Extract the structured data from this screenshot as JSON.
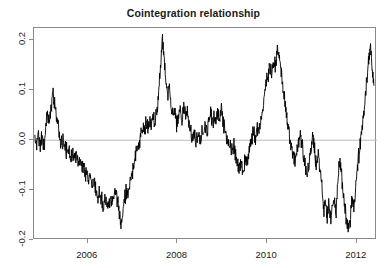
{
  "chart_data": {
    "type": "line",
    "title": "Cointegration relationship",
    "subtitle": "",
    "xlabel": "",
    "ylabel": "",
    "xlim": [
      2004.8,
      2012.45
    ],
    "ylim": [
      -0.2,
      0.225
    ],
    "grid": false,
    "legend": null,
    "zero_reference_line": 0.0,
    "line_color": "#000000",
    "zero_line_color": "#bcbcbc",
    "axis_color": "#8a8a8a",
    "background_color": "#ffffff",
    "xticks": [
      2006,
      2008,
      2010,
      2012
    ],
    "xtick_labels": [
      "2006",
      "2008",
      "2010",
      "2012"
    ],
    "yticks": [
      0.2,
      0.1,
      0.0,
      -0.1,
      -0.2
    ],
    "ytick_labels": [
      "0.2",
      "0.1",
      "0.0",
      "-0.1",
      "-0.2"
    ],
    "series": [
      {
        "name": "Cointegration residual",
        "x": [
          2004.82,
          2004.86,
          2004.9,
          2004.94,
          2004.98,
          2005.02,
          2005.06,
          2005.1,
          2005.14,
          2005.18,
          2005.22,
          2005.26,
          2005.3,
          2005.34,
          2005.38,
          2005.42,
          2005.46,
          2005.5,
          2005.54,
          2005.58,
          2005.62,
          2005.66,
          2005.7,
          2005.74,
          2005.78,
          2005.82,
          2005.86,
          2005.9,
          2005.94,
          2005.98,
          2006.02,
          2006.06,
          2006.1,
          2006.14,
          2006.18,
          2006.22,
          2006.26,
          2006.3,
          2006.34,
          2006.38,
          2006.42,
          2006.46,
          2006.5,
          2006.54,
          2006.58,
          2006.62,
          2006.66,
          2006.7,
          2006.74,
          2006.78,
          2006.82,
          2006.86,
          2006.9,
          2006.94,
          2006.98,
          2007.02,
          2007.06,
          2007.1,
          2007.14,
          2007.18,
          2007.22,
          2007.26,
          2007.3,
          2007.34,
          2007.38,
          2007.42,
          2007.46,
          2007.5,
          2007.54,
          2007.58,
          2007.62,
          2007.66,
          2007.7,
          2007.74,
          2007.78,
          2007.82,
          2007.86,
          2007.9,
          2007.94,
          2007.98,
          2008.02,
          2008.06,
          2008.1,
          2008.14,
          2008.18,
          2008.22,
          2008.26,
          2008.3,
          2008.34,
          2008.38,
          2008.42,
          2008.46,
          2008.5,
          2008.54,
          2008.58,
          2008.62,
          2008.66,
          2008.7,
          2008.74,
          2008.78,
          2008.82,
          2008.86,
          2008.9,
          2008.94,
          2008.98,
          2009.02,
          2009.06,
          2009.1,
          2009.14,
          2009.18,
          2009.22,
          2009.26,
          2009.3,
          2009.34,
          2009.38,
          2009.42,
          2009.46,
          2009.5,
          2009.54,
          2009.58,
          2009.62,
          2009.66,
          2009.7,
          2009.74,
          2009.78,
          2009.82,
          2009.86,
          2009.9,
          2009.94,
          2009.98,
          2010.02,
          2010.06,
          2010.1,
          2010.14,
          2010.18,
          2010.22,
          2010.26,
          2010.3,
          2010.34,
          2010.38,
          2010.42,
          2010.46,
          2010.5,
          2010.54,
          2010.58,
          2010.62,
          2010.66,
          2010.7,
          2010.74,
          2010.78,
          2010.82,
          2010.86,
          2010.9,
          2010.94,
          2010.98,
          2011.02,
          2011.06,
          2011.1,
          2011.14,
          2011.18,
          2011.22,
          2011.26,
          2011.3,
          2011.34,
          2011.38,
          2011.42,
          2011.46,
          2011.5,
          2011.54,
          2011.58,
          2011.62,
          2011.66,
          2011.7,
          2011.74,
          2011.78,
          2011.82,
          2011.86,
          2011.9,
          2011.94,
          2011.98,
          2012.02,
          2012.06,
          2012.1,
          2012.14,
          2012.18,
          2012.22,
          2012.26,
          2012.3,
          2012.34,
          2012.38
        ],
        "y": [
          0.0,
          -0.012,
          0.005,
          -0.008,
          0.004,
          -0.01,
          0.018,
          0.05,
          0.038,
          0.06,
          0.103,
          0.072,
          0.052,
          0.028,
          0.004,
          -0.006,
          -0.001,
          -0.012,
          -0.024,
          -0.018,
          -0.032,
          -0.026,
          -0.04,
          -0.034,
          -0.048,
          -0.042,
          -0.056,
          -0.05,
          -0.066,
          -0.06,
          -0.078,
          -0.072,
          -0.09,
          -0.084,
          -0.1,
          -0.11,
          -0.104,
          -0.118,
          -0.126,
          -0.12,
          -0.132,
          -0.126,
          -0.118,
          -0.128,
          -0.112,
          -0.104,
          -0.122,
          -0.142,
          -0.172,
          -0.14,
          -0.118,
          -0.1,
          -0.108,
          -0.088,
          -0.07,
          -0.056,
          -0.036,
          -0.02,
          -0.008,
          0.01,
          0.026,
          0.018,
          0.034,
          0.026,
          0.04,
          0.03,
          0.048,
          0.036,
          0.058,
          0.092,
          0.14,
          0.212,
          0.168,
          0.12,
          0.09,
          0.104,
          0.072,
          0.052,
          0.06,
          0.03,
          0.046,
          0.055,
          0.04,
          0.06,
          0.05,
          0.056,
          0.038,
          0.018,
          0.0,
          0.014,
          -0.008,
          0.01,
          -0.004,
          0.02,
          0.006,
          0.03,
          0.014,
          0.044,
          0.056,
          0.03,
          0.048,
          0.034,
          0.054,
          0.04,
          0.06,
          0.038,
          0.022,
          0.006,
          -0.014,
          -0.004,
          -0.022,
          -0.012,
          -0.03,
          -0.046,
          -0.058,
          -0.05,
          -0.062,
          -0.04,
          -0.048,
          -0.03,
          -0.014,
          0.004,
          0.018,
          0.006,
          0.026,
          0.014,
          0.04,
          0.06,
          0.09,
          0.118,
          0.13,
          0.15,
          0.138,
          0.16,
          0.148,
          0.172,
          0.176,
          0.15,
          0.12,
          0.09,
          0.06,
          0.032,
          0.01,
          -0.012,
          -0.028,
          -0.044,
          -0.026,
          -0.008,
          0.012,
          -0.01,
          -0.032,
          -0.055,
          -0.07,
          -0.04,
          -0.014,
          0.01,
          -0.02,
          -0.05,
          -0.03,
          -0.06,
          -0.09,
          -0.14,
          -0.122,
          -0.15,
          -0.128,
          -0.16,
          -0.138,
          -0.12,
          -0.142,
          -0.08,
          -0.04,
          -0.07,
          -0.11,
          -0.14,
          -0.17,
          -0.182,
          -0.15,
          -0.12,
          -0.13,
          -0.09,
          -0.05,
          -0.02,
          0.01,
          0.04,
          0.08,
          0.12,
          0.16,
          0.184,
          0.15,
          0.11
        ]
      }
    ],
    "note": "Dense mean-reverting residual series with major positive spikes near 2006.4 (0.21), 2008.1 (0.18), 2009.1 (0.185), 2011.6 (0.21) and deep negative troughs near 2005.7 (-0.17) and 2008.8 (-0.185)."
  },
  "axes": {
    "y_ticks": [
      {
        "label": "0.2",
        "value": 0.2
      },
      {
        "label": "0.1",
        "value": 0.1
      },
      {
        "label": "0.0",
        "value": 0.0
      },
      {
        "label": "-0.1",
        "value": -0.1
      },
      {
        "label": "-0.2",
        "value": -0.2
      }
    ],
    "x_ticks": [
      {
        "label": "2006",
        "value": 2006
      },
      {
        "label": "2008",
        "value": 2008
      },
      {
        "label": "2010",
        "value": 2010
      },
      {
        "label": "2012",
        "value": 2012
      }
    ]
  }
}
